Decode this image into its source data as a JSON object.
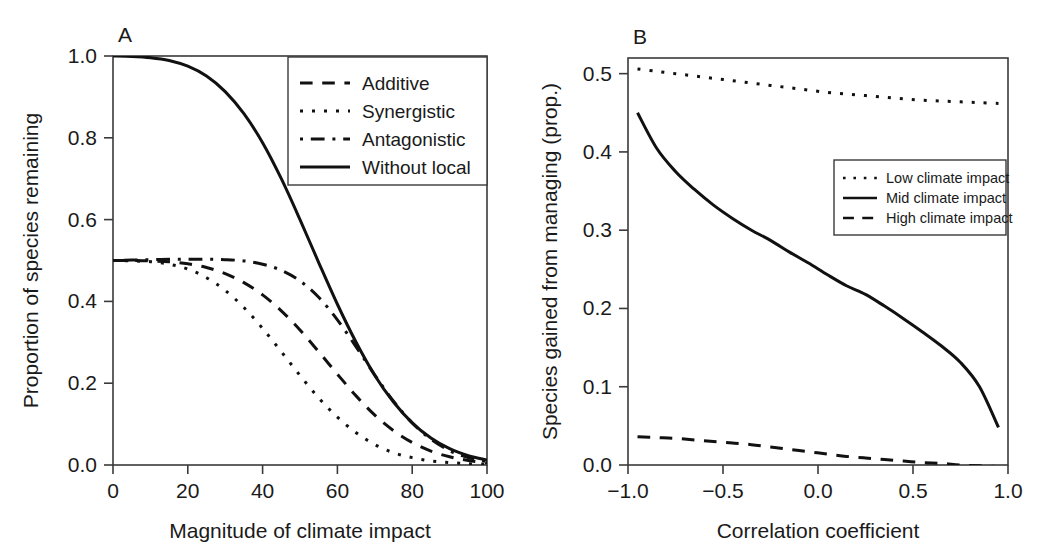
{
  "figure": {
    "background": "#ffffff",
    "ink_color": "#111111",
    "axis_color": "#3a3a3a"
  },
  "panels": [
    {
      "id": "A",
      "label": "A"
    },
    {
      "id": "B",
      "label": "B"
    }
  ],
  "chart_data": [
    {
      "type": "line",
      "panel": "A",
      "title": "A",
      "xlabel": "Magnitude of climate impact",
      "ylabel": "Proportion of species remaining",
      "xlim": [
        0,
        100
      ],
      "ylim": [
        0,
        1.0
      ],
      "xticks": [
        0,
        20,
        40,
        60,
        80,
        100
      ],
      "xtick_labels": [
        "0",
        "20",
        "40",
        "60",
        "80",
        "100"
      ],
      "yticks": [
        0.0,
        0.2,
        0.4,
        0.6,
        0.8,
        1.0
      ],
      "ytick_labels": [
        "0.0",
        "0.2",
        "0.4",
        "0.6",
        "0.8",
        "1.0"
      ],
      "grid": false,
      "legend_position": "top-right",
      "legend_entries": [
        {
          "label": "Additive",
          "style": "dashed"
        },
        {
          "label": "Synergistic",
          "style": "dotted"
        },
        {
          "label": "Antagonistic",
          "style": "dashdot"
        },
        {
          "label": "Without local",
          "style": "solid"
        }
      ],
      "x": [
        0,
        5,
        10,
        15,
        20,
        25,
        30,
        35,
        40,
        45,
        50,
        55,
        60,
        65,
        70,
        75,
        80,
        85,
        90,
        95,
        100
      ],
      "series": [
        {
          "name": "Additive",
          "style": "dashed",
          "values": [
            0.5,
            0.5,
            0.499,
            0.497,
            0.492,
            0.483,
            0.468,
            0.446,
            0.416,
            0.377,
            0.33,
            0.277,
            0.222,
            0.169,
            0.122,
            0.084,
            0.055,
            0.034,
            0.02,
            0.011,
            0.005
          ]
        },
        {
          "name": "Synergistic",
          "style": "dotted",
          "values": [
            0.5,
            0.499,
            0.497,
            0.491,
            0.479,
            0.458,
            0.427,
            0.385,
            0.334,
            0.277,
            0.219,
            0.164,
            0.117,
            0.079,
            0.05,
            0.03,
            0.018,
            0.01,
            0.006,
            0.003,
            0.002
          ]
        },
        {
          "name": "Antagonistic",
          "style": "dashdot",
          "values": [
            0.5,
            0.501,
            0.502,
            0.503,
            0.503,
            0.503,
            0.502,
            0.499,
            0.491,
            0.476,
            0.45,
            0.41,
            0.355,
            0.289,
            0.22,
            0.156,
            0.103,
            0.063,
            0.035,
            0.018,
            0.008
          ]
        },
        {
          "name": "Without local",
          "style": "solid",
          "values": [
            1.0,
            0.999,
            0.996,
            0.989,
            0.975,
            0.951,
            0.913,
            0.859,
            0.788,
            0.7,
            0.6,
            0.495,
            0.393,
            0.3,
            0.219,
            0.154,
            0.103,
            0.066,
            0.04,
            0.023,
            0.012
          ]
        }
      ]
    },
    {
      "type": "line",
      "panel": "B",
      "title": "B",
      "xlabel": "Correlation coefficient",
      "ylabel": "Species gained from managing (prop.)",
      "xlim": [
        -1.0,
        1.0
      ],
      "ylim": [
        0.0,
        0.52
      ],
      "xticks": [
        -1.0,
        -0.5,
        0.0,
        0.5,
        1.0
      ],
      "xtick_labels": [
        "−1.0",
        "−0.5",
        "0.0",
        "0.5",
        "1.0"
      ],
      "yticks": [
        0.0,
        0.1,
        0.2,
        0.3,
        0.4,
        0.5
      ],
      "ytick_labels": [
        "0.0",
        "0.1",
        "0.2",
        "0.3",
        "0.4",
        "0.5"
      ],
      "grid": false,
      "legend_position": "middle-right",
      "legend_entries": [
        {
          "label": "Low climate impact",
          "style": "dotted"
        },
        {
          "label": "Mid climate impact",
          "style": "solid"
        },
        {
          "label": "High climate impact",
          "style": "dashed"
        }
      ],
      "x": [
        -0.95,
        -0.85,
        -0.75,
        -0.65,
        -0.55,
        -0.45,
        -0.35,
        -0.25,
        -0.15,
        -0.05,
        0.05,
        0.15,
        0.25,
        0.35,
        0.45,
        0.55,
        0.65,
        0.75,
        0.85,
        0.95
      ],
      "series": [
        {
          "name": "Low climate impact",
          "style": "dotted",
          "values": [
            0.506,
            0.503,
            0.5,
            0.497,
            0.494,
            0.491,
            0.488,
            0.485,
            0.482,
            0.479,
            0.476,
            0.474,
            0.472,
            0.47,
            0.468,
            0.466,
            0.465,
            0.464,
            0.463,
            0.462
          ]
        },
        {
          "name": "Mid climate impact",
          "style": "solid",
          "values": [
            0.45,
            0.405,
            0.375,
            0.352,
            0.332,
            0.315,
            0.3,
            0.287,
            0.272,
            0.258,
            0.243,
            0.229,
            0.218,
            0.203,
            0.187,
            0.17,
            0.152,
            0.131,
            0.1,
            0.048
          ]
        },
        {
          "name": "High climate impact",
          "style": "dashed",
          "values": [
            0.036,
            0.035,
            0.034,
            0.032,
            0.03,
            0.028,
            0.026,
            0.023,
            0.02,
            0.017,
            0.014,
            0.011,
            0.009,
            0.007,
            0.005,
            0.003,
            0.002,
            0.0,
            -0.001,
            -0.002
          ]
        }
      ]
    }
  ]
}
